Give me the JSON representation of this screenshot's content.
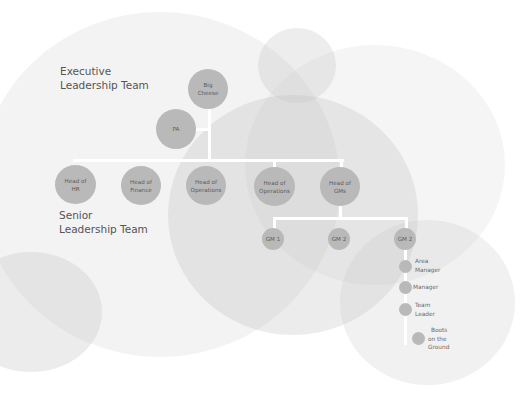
{
  "sections": {
    "executive": {
      "line1": "Executive",
      "line2": "Leadership Team"
    },
    "senior": {
      "line1": "Senior",
      "line2": "Leadership Team"
    }
  },
  "nodes": {
    "big_cheese": {
      "line1": "Big",
      "line2": "Cheese"
    },
    "pa": {
      "line1": "PA"
    },
    "head_hr": {
      "line1": "Head of",
      "line2": "HR"
    },
    "head_finance": {
      "line1": "Head of",
      "line2": "Finance"
    },
    "head_operations_1": {
      "line1": "Head of",
      "line2": "Operations"
    },
    "head_operations_2": {
      "line1": "Head of",
      "line2": "Operations"
    },
    "head_gms": {
      "line1": "Head of",
      "line2": "GMs"
    },
    "gm1": {
      "line1": "GM 1"
    },
    "gm2a": {
      "line1": "GM 2"
    },
    "gm2b": {
      "line1": "GM 2"
    }
  },
  "chain": [
    {
      "line1": "Area",
      "line2": "Manager"
    },
    {
      "line1": "Manager"
    },
    {
      "line1": "Team",
      "line2": "Leader"
    },
    {
      "line1": "Boots",
      "line2": "on the",
      "line3": "Ground"
    }
  ],
  "colors": {
    "node": "#b9b9b9",
    "connector": "#ffffff",
    "text": "#555555"
  }
}
